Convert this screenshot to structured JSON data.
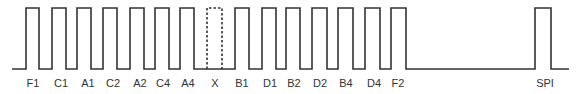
{
  "diagram": {
    "stroke_color": "#333333",
    "baseline_y": 69,
    "top_y": 8,
    "baseline_start_x": 12,
    "baseline_end_x": 569,
    "pulses": [
      {
        "label": "F1",
        "x1": 26,
        "x2": 39,
        "label_x": 33,
        "dashed": false
      },
      {
        "label": "C1",
        "x1": 52,
        "x2": 66,
        "label_x": 61,
        "dashed": false
      },
      {
        "label": "A1",
        "x1": 77,
        "x2": 91,
        "label_x": 88,
        "dashed": false
      },
      {
        "label": "C2",
        "x1": 103,
        "x2": 117,
        "label_x": 113,
        "dashed": false
      },
      {
        "label": "A2",
        "x1": 130,
        "x2": 144,
        "label_x": 140,
        "dashed": false
      },
      {
        "label": "C4",
        "x1": 155,
        "x2": 169,
        "label_x": 163,
        "dashed": false
      },
      {
        "label": "A4",
        "x1": 180,
        "x2": 194,
        "label_x": 188,
        "dashed": false
      },
      {
        "label": "X",
        "x1": 207,
        "x2": 222,
        "label_x": 215,
        "dashed": true
      },
      {
        "label": "B1",
        "x1": 235,
        "x2": 249,
        "label_x": 242,
        "dashed": false
      },
      {
        "label": "D1",
        "x1": 262,
        "x2": 276,
        "label_x": 270,
        "dashed": false
      },
      {
        "label": "B2",
        "x1": 286,
        "x2": 300,
        "label_x": 294,
        "dashed": false
      },
      {
        "label": "D2",
        "x1": 312,
        "x2": 327,
        "label_x": 320,
        "dashed": false
      },
      {
        "label": "B4",
        "x1": 338,
        "x2": 353,
        "label_x": 346,
        "dashed": false
      },
      {
        "label": "D4",
        "x1": 365,
        "x2": 380,
        "label_x": 374,
        "dashed": false
      },
      {
        "label": "F2",
        "x1": 391,
        "x2": 406,
        "label_x": 398,
        "dashed": false
      },
      {
        "label": "SPI",
        "x1": 535,
        "x2": 551,
        "label_x": 545,
        "dashed": false
      }
    ]
  }
}
